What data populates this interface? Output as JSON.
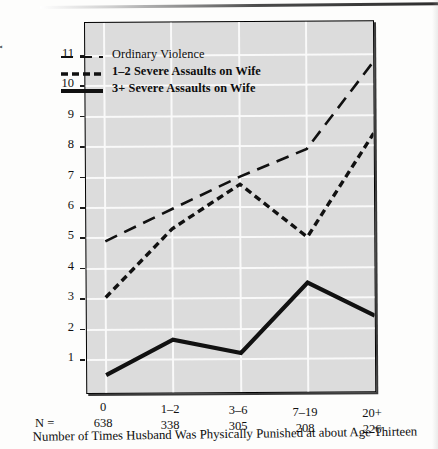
{
  "chart_data": {
    "type": "line",
    "title": "",
    "xlabel": "Number of Times Husband Was Physically Punished at about Age Thirteen",
    "ylabel": "Violence Rate per 100 Husbands",
    "categories": [
      "0",
      "1–2",
      "3–6",
      "7–19",
      "20+"
    ],
    "sample_sizes": [
      "638",
      "338",
      "305",
      "208",
      "226"
    ],
    "sample_size_prefix": "N =",
    "ylim": [
      0,
      11.6
    ],
    "yticks": [
      1,
      2,
      3,
      4,
      5,
      6,
      7,
      8,
      9,
      10,
      11
    ],
    "ytick_labels": [
      "1",
      "2",
      "3",
      "4",
      "5",
      "6",
      "7",
      "8",
      "9",
      "10",
      "11"
    ],
    "grid": true,
    "legend_position": "upper-left",
    "series": [
      {
        "name": "Ordinary Violence",
        "style": "long-dash",
        "values": [
          4.9,
          5.95,
          7.0,
          7.9,
          10.75
        ]
      },
      {
        "name": "1–2 Severe Assaults on Wife",
        "style": "short-dash",
        "values": [
          3.05,
          5.3,
          6.75,
          5.0,
          8.4
        ]
      },
      {
        "name": "3+ Severe Assaults on Wife",
        "style": "solid",
        "values": [
          0.5,
          1.65,
          1.2,
          3.5,
          2.4
        ]
      }
    ]
  },
  "legend": {
    "items": [
      {
        "label": "Ordinary Violence",
        "style": "long-dash"
      },
      {
        "label": "1–2 Severe Assaults on Wife",
        "style": "short-dash"
      },
      {
        "label": "3+ Severe Assaults on Wife",
        "style": "solid"
      }
    ]
  },
  "colors": {
    "plot_background": "#dcdcdc",
    "gridline": "#fafafa",
    "line": "#111111",
    "frame": "#000000",
    "page_background": "#fdfdfc"
  }
}
